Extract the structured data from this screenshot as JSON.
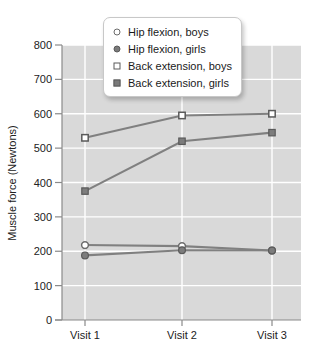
{
  "chart_data": {
    "type": "line",
    "title": "",
    "xlabel": "",
    "ylabel": "Muscle force (Newtons)",
    "categories": [
      "Visit 1",
      "Visit 2",
      "Visit 3"
    ],
    "ylim": [
      0,
      800
    ],
    "yticks": [
      0,
      100,
      200,
      300,
      400,
      500,
      600,
      700,
      800
    ],
    "ytick_labels": [
      "0",
      "100",
      "200",
      "300",
      "400",
      "500",
      "600",
      "700",
      "800"
    ],
    "grid": true,
    "grid_color": "#ffffff",
    "plot_background": "#d9d9d9",
    "legend_position": "top-center",
    "series": [
      {
        "name": "Hip flexion, boys",
        "marker": "open-circle",
        "color": "#808080",
        "values": [
          218,
          215,
          202
        ]
      },
      {
        "name": "Hip flexion, girls",
        "marker": "filled-circle",
        "color": "#808080",
        "values": [
          188,
          203,
          202
        ]
      },
      {
        "name": "Back extension, boys",
        "marker": "open-square",
        "color": "#808080",
        "values": [
          530,
          595,
          600
        ]
      },
      {
        "name": "Back extension, girls",
        "marker": "filled-square",
        "color": "#808080",
        "values": [
          375,
          520,
          545
        ]
      }
    ]
  },
  "legend": {
    "items": [
      {
        "label": "Hip flexion, boys",
        "marker": "open-circle"
      },
      {
        "label": "Hip flexion, girls",
        "marker": "filled-circle"
      },
      {
        "label": "Back extension, boys",
        "marker": "open-square"
      },
      {
        "label": "Back extension, girls",
        "marker": "filled-square"
      }
    ]
  },
  "axes": {
    "y_title": "Muscle force (Newtons)",
    "y_labels": [
      "800",
      "700",
      "600",
      "500",
      "400",
      "300",
      "200",
      "100",
      "0"
    ],
    "x_labels": [
      "Visit 1",
      "Visit 2",
      "Visit 3"
    ]
  }
}
